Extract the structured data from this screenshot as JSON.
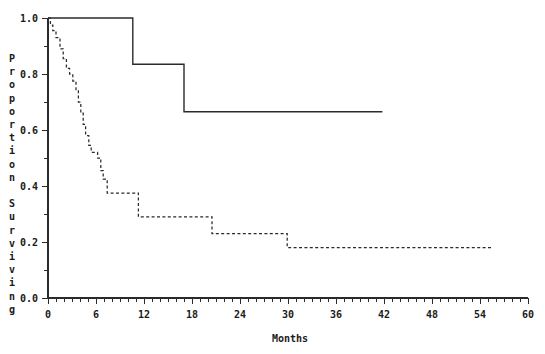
{
  "chart_data": {
    "type": "line",
    "title": "",
    "xlabel": "Months",
    "ylabel": "Proportion Surviving",
    "ylabel_chars": [
      "P",
      "r",
      "o",
      "p",
      "o",
      "r",
      "t",
      "i",
      "o",
      "n",
      "",
      "S",
      "u",
      "r",
      "v",
      "i",
      "v",
      "i",
      "n",
      "g"
    ],
    "xlim": [
      0,
      60
    ],
    "ylim": [
      0.0,
      1.0
    ],
    "x_ticks_major": [
      0,
      6,
      12,
      18,
      24,
      30,
      36,
      42,
      48,
      54,
      60
    ],
    "x_tick_labels": [
      "0",
      "6",
      "12",
      "18",
      "24",
      "30",
      "36",
      "42",
      "48",
      "54",
      "60"
    ],
    "x_minor_tick_interval": 1,
    "y_ticks_major": [
      0.0,
      0.2,
      0.4,
      0.6,
      0.8,
      1.0
    ],
    "y_tick_labels": [
      "0.0",
      "0.2",
      "0.4",
      "0.6",
      "0.8",
      "1.0"
    ],
    "y_minor_ticks": [
      0.1,
      0.3,
      0.5,
      0.7,
      0.9
    ],
    "grid": false,
    "legend": "none",
    "axis_color": "#2b2b2b",
    "background_color": "#ffffff",
    "series": [
      {
        "name": "Group A (solid)",
        "style": "solid",
        "color": "#2b2b2b",
        "step": "post",
        "x": [
          0.0,
          10.6,
          10.6,
          17.0,
          17.0,
          41.8
        ],
        "y": [
          1.0,
          1.0,
          0.835,
          0.835,
          0.665,
          0.665
        ],
        "steps": [
          {
            "month": 0.0,
            "survival": 1.0
          },
          {
            "month": 10.6,
            "survival": 0.835
          },
          {
            "month": 17.0,
            "survival": 0.665
          },
          {
            "month": 41.8,
            "survival": 0.665
          }
        ]
      },
      {
        "name": "Group B (dashed)",
        "style": "dashed",
        "color": "#2b2b2b",
        "step": "post",
        "steps": [
          {
            "month": 0.0,
            "survival": 1.0
          },
          {
            "month": 0.3,
            "survival": 0.975
          },
          {
            "month": 0.6,
            "survival": 0.955
          },
          {
            "month": 1.0,
            "survival": 0.93
          },
          {
            "month": 1.5,
            "survival": 0.89
          },
          {
            "month": 1.9,
            "survival": 0.855
          },
          {
            "month": 2.3,
            "survival": 0.82
          },
          {
            "month": 2.7,
            "survival": 0.8
          },
          {
            "month": 3.1,
            "survival": 0.775
          },
          {
            "month": 3.5,
            "survival": 0.74
          },
          {
            "month": 3.8,
            "survival": 0.7
          },
          {
            "month": 4.1,
            "survival": 0.66
          },
          {
            "month": 4.4,
            "survival": 0.62
          },
          {
            "month": 4.7,
            "survival": 0.58
          },
          {
            "month": 5.1,
            "survival": 0.545
          },
          {
            "month": 5.4,
            "survival": 0.52
          },
          {
            "month": 6.2,
            "survival": 0.5
          },
          {
            "month": 6.6,
            "survival": 0.455
          },
          {
            "month": 6.9,
            "survival": 0.425
          },
          {
            "month": 7.4,
            "survival": 0.375
          },
          {
            "month": 11.3,
            "survival": 0.29
          },
          {
            "month": 20.5,
            "survival": 0.23
          },
          {
            "month": 29.9,
            "survival": 0.18
          },
          {
            "month": 55.5,
            "survival": 0.18
          }
        ]
      }
    ]
  }
}
